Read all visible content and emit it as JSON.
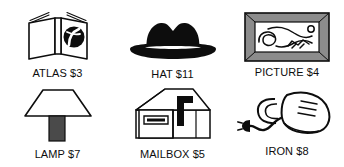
{
  "sheet": {
    "title": "Item price picture cards",
    "background_color": "#ffffff",
    "ink_color": "#0d0d0d",
    "accent_gray": "#8c8c8c",
    "stem_gray": "#4a4a4a",
    "columns": 3,
    "rows": 2
  },
  "items": [
    {
      "id": "atlas",
      "icon": "open-book-globe-icon",
      "name": "ATLAS",
      "price": "$3",
      "caption": "ATLAS $3"
    },
    {
      "id": "hat",
      "icon": "fedora-hat-icon",
      "name": "HAT",
      "price": "$11",
      "caption": "HAT $11"
    },
    {
      "id": "picture",
      "icon": "framed-picture-icon",
      "name": "PICTURE",
      "price": "$4",
      "caption": "PICTURE $4"
    },
    {
      "id": "lamp",
      "icon": "table-lamp-icon",
      "name": "LAMP",
      "price": "$7",
      "caption": "LAMP $7"
    },
    {
      "id": "mailbox",
      "icon": "mailbox-flag-icon",
      "name": "MAILBOX",
      "price": "$5",
      "caption": "MAILBOX $5"
    },
    {
      "id": "iron",
      "icon": "clothes-iron-cord-icon",
      "name": "IRON",
      "price": "$8",
      "caption": "IRON $8"
    }
  ]
}
